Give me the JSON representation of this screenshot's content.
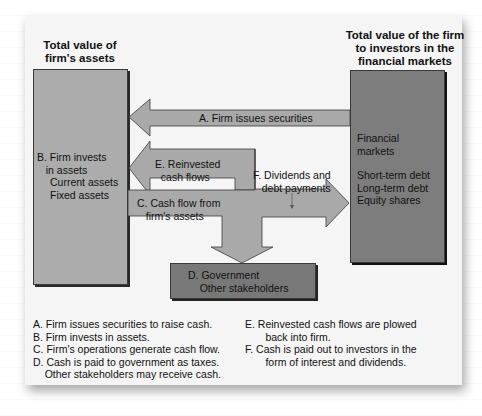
{
  "headings": {
    "left": "Total value of\nfirm's assets",
    "right": "Total value of the\nfirm to investors in\nthe financial markets"
  },
  "boxes": {
    "firm_assets": {
      "title": "B. Firm invests\n   in assets",
      "items": "Current assets\nFixed assets",
      "color": "#acacac"
    },
    "financial_markets": {
      "title": "Financial\nmarkets",
      "items": "Short-term debt\nLong-term debt\nEquity shares",
      "color": "#7d7d7d"
    },
    "government": {
      "title": "D. Government\n    Other stakeholders",
      "color": "#787878"
    }
  },
  "arrows": {
    "a": "A. Firm issues securities",
    "e": "E. Reinvested\n  cash flows",
    "c": "C. Cash flow from\n   firm's assets",
    "f": "F. Dividends and\n   debt payments",
    "color": "#a9a9a9"
  },
  "legend": {
    "left": [
      "A. Firm issues securities to raise cash.",
      "B. Firm invests in assets.",
      "C. Firm's operations generate cash flow.",
      "D. Cash is paid to government as taxes.",
      "    Other stakeholders may receive cash."
    ],
    "right": [
      "E. Reinvested cash flows are plowed",
      "       back into firm.",
      "F. Cash is paid out to investors in the",
      "       form of interest and dividends."
    ]
  }
}
